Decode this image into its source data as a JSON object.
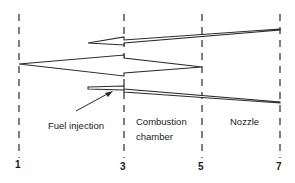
{
  "diagram": {
    "type": "engine-station-flow-diagram",
    "stations": [
      {
        "id": "1",
        "label": "1",
        "x": 19
      },
      {
        "id": "3",
        "label": "3",
        "x": 124
      },
      {
        "id": "5",
        "label": "5",
        "x": 202
      },
      {
        "id": "7",
        "label": "7",
        "x": 280
      }
    ],
    "regions": [
      {
        "name": "fuel-injection",
        "label": "Fuel injection"
      },
      {
        "name": "combustion-chamber",
        "label_line1": "Combustion",
        "label_line2": "chamber"
      },
      {
        "name": "nozzle",
        "label": "Nozzle"
      }
    ],
    "arrows": [
      {
        "name": "top-arrow",
        "from_station": "7",
        "to": "left of 3",
        "direction": "left"
      },
      {
        "name": "middle-arrow",
        "from_station": "5",
        "to_station": "1",
        "direction": "left"
      },
      {
        "name": "bottom-arrow",
        "from_station": "7",
        "to": "left of 3",
        "direction": "left"
      }
    ],
    "colors": {
      "line": "#2a2a2a",
      "background": "#ffffff"
    }
  }
}
